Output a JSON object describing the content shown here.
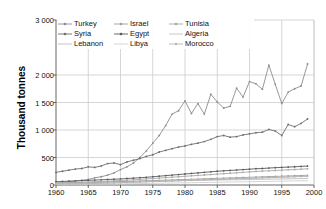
{
  "chart_data": {
    "type": "line",
    "title": "",
    "xlabel": "",
    "ylabel": "Thousand tonnes",
    "xlim": [
      1960,
      2000
    ],
    "ylim": [
      0,
      3000
    ],
    "xticks": [
      "1960",
      "1965",
      "1970",
      "1975",
      "1980",
      "1985",
      "1990",
      "1995",
      "2000"
    ],
    "yticks": [
      "0",
      "500",
      "1 000",
      "1 500",
      "2 000",
      "3 000"
    ],
    "ytick_values": [
      0,
      500,
      1000,
      1500,
      2000,
      3000
    ],
    "gridlines": "both",
    "legend_position": "top-left-inside",
    "x": [
      1960,
      1961,
      1962,
      1963,
      1964,
      1965,
      1966,
      1967,
      1968,
      1969,
      1970,
      1971,
      1972,
      1973,
      1974,
      1975,
      1976,
      1977,
      1978,
      1979,
      1980,
      1981,
      1982,
      1983,
      1984,
      1985,
      1986,
      1987,
      1988,
      1989,
      1990,
      1991,
      1992,
      1993,
      1994,
      1995,
      1996,
      1997,
      1998,
      1999
    ],
    "series": [
      {
        "name": "Turkey",
        "color": "#8c8c8c",
        "marker": "dot",
        "values": [
          30,
          45,
          60,
          70,
          85,
          100,
          130,
          150,
          180,
          220,
          280,
          330,
          400,
          500,
          620,
          760,
          900,
          1080,
          1290,
          1350,
          1530,
          1300,
          1480,
          1290,
          1650,
          1510,
          1400,
          1430,
          1760,
          1600,
          1880,
          1840,
          1740,
          2180,
          1830,
          1480,
          1690,
          1750,
          1800,
          2200
        ]
      },
      {
        "name": "Syria",
        "color": "#6e6e6e",
        "marker": "dot",
        "values": [
          230,
          250,
          270,
          290,
          300,
          330,
          320,
          345,
          390,
          400,
          370,
          420,
          450,
          480,
          520,
          550,
          600,
          630,
          660,
          690,
          710,
          740,
          760,
          790,
          830,
          880,
          900,
          870,
          880,
          910,
          930,
          950,
          960,
          1010,
          980,
          900,
          1100,
          1060,
          1120,
          1200
        ]
      },
      {
        "name": "Lebanon",
        "color": "#bdbdbd",
        "marker": "none",
        "values": [
          40,
          42,
          45,
          46,
          48,
          50,
          52,
          54,
          56,
          58,
          60,
          62,
          64,
          66,
          68,
          70,
          72,
          74,
          76,
          78,
          80,
          82,
          84,
          86,
          88,
          90,
          92,
          94,
          96,
          98,
          100,
          102,
          104,
          106,
          108,
          110,
          112,
          114,
          116,
          118
        ]
      },
      {
        "name": "Israel",
        "color": "#9e9e9e",
        "marker": "dot",
        "values": [
          25,
          28,
          30,
          33,
          36,
          40,
          44,
          48,
          52,
          56,
          60,
          64,
          68,
          72,
          76,
          80,
          84,
          88,
          92,
          96,
          100,
          104,
          108,
          112,
          116,
          120,
          124,
          128,
          132,
          136,
          140,
          144,
          148,
          152,
          156,
          160,
          164,
          168,
          172,
          176
        ]
      },
      {
        "name": "Egypt",
        "color": "#5a5a5a",
        "marker": "dot",
        "values": [
          60,
          65,
          70,
          75,
          80,
          85,
          90,
          95,
          100,
          105,
          110,
          118,
          125,
          132,
          140,
          150,
          160,
          170,
          180,
          190,
          200,
          210,
          220,
          230,
          240,
          250,
          258,
          265,
          272,
          280,
          288,
          296,
          300,
          308,
          315,
          320,
          326,
          332,
          338,
          345
        ]
      },
      {
        "name": "Libya",
        "color": "#cfcfcf",
        "marker": "none",
        "values": [
          10,
          11,
          12,
          13,
          14,
          15,
          16,
          17,
          18,
          19,
          20,
          22,
          24,
          26,
          28,
          30,
          32,
          34,
          36,
          38,
          40,
          42,
          44,
          46,
          48,
          50,
          52,
          54,
          56,
          58,
          60,
          62,
          64,
          66,
          68,
          70,
          72,
          74,
          76,
          78
        ]
      },
      {
        "name": "Tunisia",
        "color": "#a8a8a8",
        "marker": "dot",
        "values": [
          35,
          38,
          42,
          46,
          50,
          55,
          60,
          65,
          70,
          76,
          82,
          88,
          95,
          102,
          110,
          118,
          126,
          134,
          142,
          150,
          158,
          166,
          174,
          182,
          190,
          198,
          206,
          214,
          222,
          230,
          238,
          246,
          252,
          258,
          264,
          270,
          276,
          282,
          288,
          295
        ]
      },
      {
        "name": "Algeria",
        "color": "#c4c4c4",
        "marker": "none",
        "values": [
          20,
          22,
          24,
          26,
          28,
          30,
          33,
          36,
          39,
          42,
          45,
          48,
          52,
          56,
          60,
          64,
          68,
          72,
          76,
          80,
          84,
          88,
          92,
          96,
          100,
          104,
          108,
          112,
          116,
          120,
          124,
          128,
          132,
          136,
          140,
          144,
          148,
          152,
          156,
          160
        ]
      },
      {
        "name": "Morocco",
        "color": "#b5b5b5",
        "marker": "dot",
        "values": [
          15,
          17,
          19,
          21,
          23,
          26,
          29,
          32,
          35,
          38,
          42,
          46,
          50,
          54,
          58,
          62,
          66,
          70,
          74,
          78,
          82,
          86,
          90,
          94,
          98,
          102,
          106,
          110,
          114,
          118,
          122,
          126,
          130,
          134,
          138,
          142,
          146,
          150,
          154,
          158
        ]
      }
    ],
    "legend": [
      {
        "label": "Turkey"
      },
      {
        "label": "Israel"
      },
      {
        "label": "Tunisia"
      },
      {
        "label": "Syria"
      },
      {
        "label": "Egypt"
      },
      {
        "label": "Algeria"
      },
      {
        "label": "Lebanon"
      },
      {
        "label": "Libya"
      },
      {
        "label": "Morocco"
      }
    ]
  }
}
